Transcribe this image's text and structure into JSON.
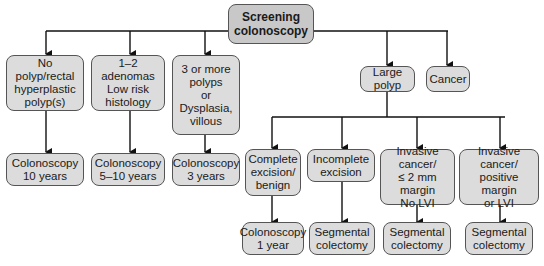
{
  "root": {
    "line1": "Screening",
    "line2": "colonoscopy"
  },
  "level1": [
    {
      "lines": [
        "No polyp/rectal",
        "hyperplastic",
        "polyp(s)"
      ]
    },
    {
      "lines": [
        "1–2 adenomas",
        "Low risk",
        "histology"
      ]
    },
    {
      "lines": [
        "3 or more",
        "polyps",
        "or",
        "Dysplasia,",
        "villous"
      ]
    },
    {
      "lines": [
        "Large polyp"
      ]
    },
    {
      "lines": [
        "Cancer"
      ]
    }
  ],
  "level1_outcomes": [
    {
      "lines": [
        "Colonoscopy",
        "10 years"
      ]
    },
    {
      "lines": [
        "Colonoscopy",
        "5–10 years"
      ]
    },
    {
      "lines": [
        "Colonoscopy",
        "3 years"
      ]
    }
  ],
  "large_polyp_branches": [
    {
      "lines": [
        "Complete",
        "excision/",
        "benign"
      ]
    },
    {
      "lines": [
        "Incomplete",
        "excision"
      ]
    },
    {
      "lines": [
        "Invasive",
        "cancer/",
        "≤ 2 mm margin",
        "No LVI"
      ]
    },
    {
      "lines": [
        "Invasive",
        "cancer/",
        "positive margin",
        "or LVI"
      ]
    }
  ],
  "large_polyp_outcomes": [
    {
      "lines": [
        "Colonoscopy",
        "1 year"
      ]
    },
    {
      "lines": [
        "Segmental",
        "colectomy"
      ]
    },
    {
      "lines": [
        "Segmental",
        "colectomy"
      ]
    },
    {
      "lines": [
        "Segmental",
        "colectomy"
      ]
    }
  ]
}
